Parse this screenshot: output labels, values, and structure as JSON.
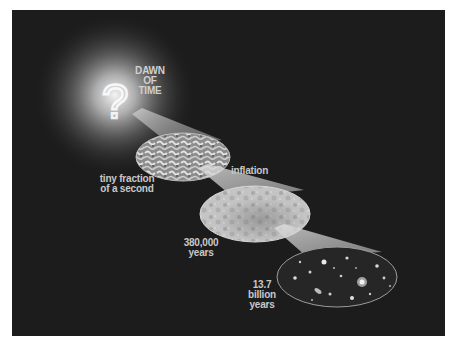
{
  "diagram": {
    "type": "timeline-illustration",
    "colors": {
      "background_page": "#ffffff",
      "panel": "#1c1c1c",
      "glow": "#ffffff",
      "text": "#c8c8c8"
    },
    "origin": {
      "icon": "question-mark",
      "glyph": "?",
      "label_lines": [
        "DAWN",
        "OF",
        "TIME"
      ]
    },
    "stages": [
      {
        "name": "inflation",
        "label_lines": [
          "inflation"
        ],
        "time_label_lines": [
          "tiny fraction",
          "of a second"
        ],
        "texture": "turbulent-fluctuations"
      },
      {
        "name": "cosmic-microwave-background",
        "time_label_lines": [
          "380,000",
          "years"
        ],
        "texture": "mottled-cmb"
      },
      {
        "name": "present-day-galaxies",
        "time_label_lines": [
          "13.7",
          "billion",
          "years"
        ],
        "texture": "galaxy-field"
      }
    ]
  }
}
